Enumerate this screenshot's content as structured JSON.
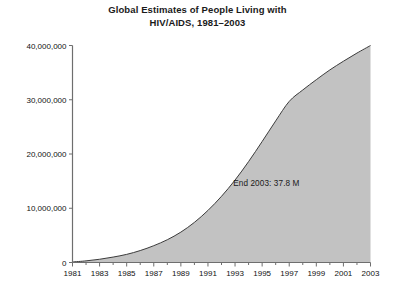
{
  "chart_data": {
    "type": "area",
    "title": "Global Estimates of People Living with HIV/AIDS, 1981–2003",
    "title_line_1": "Global Estimates of People Living with",
    "title_line_2": "HIV/AIDS, 1981–2003",
    "xlabel": "",
    "ylabel": "",
    "xlim": [
      1981,
      2003
    ],
    "ylim": [
      0,
      40000000
    ],
    "grid": false,
    "legend": null,
    "fill_color": "#c2c2c2",
    "line_color": "#3c3c3c",
    "axis_color": "#6e6e6e",
    "annotations": [
      {
        "text": "End 2003: 37.8 M",
        "x": 1997,
        "y": 14500000
      }
    ],
    "ytick_labels": [
      "40,000,000",
      "30,000,000",
      "20,000,000",
      "10,000,000",
      "0"
    ],
    "ytick_values": [
      40000000,
      30000000,
      20000000,
      10000000,
      0
    ],
    "xtick_labels": [
      "1981",
      "1983",
      "1985",
      "1987",
      "1989",
      "1991",
      "1993",
      "1995",
      "1997",
      "1999",
      "2001",
      "2003"
    ],
    "xtick_values": [
      1981,
      1983,
      1985,
      1987,
      1989,
      1991,
      1993,
      1995,
      1997,
      1999,
      2001,
      2003
    ],
    "xminor_values": [
      1982,
      1984,
      1986,
      1988,
      1990,
      1992,
      1994,
      1996,
      1998,
      2000,
      2002
    ],
    "x": [
      1981,
      1982,
      1983,
      1984,
      1985,
      1986,
      1987,
      1988,
      1989,
      1990,
      1991,
      1992,
      1993,
      1994,
      1995,
      1996,
      1997,
      1998,
      1999,
      2000,
      2001,
      2002,
      2003
    ],
    "values": [
      100000,
      300000,
      600000,
      1000000,
      1500000,
      2200000,
      3100000,
      4200000,
      5600000,
      7400000,
      9600000,
      12200000,
      15200000,
      18600000,
      22300000,
      26100000,
      29700000,
      31800000,
      33700000,
      35500000,
      37100000,
      38600000,
      40000000
    ],
    "series": [
      {
        "name": "People living with HIV/AIDS",
        "values": [
          100000,
          300000,
          600000,
          1000000,
          1500000,
          2200000,
          3100000,
          4200000,
          5600000,
          7400000,
          9600000,
          12200000,
          15200000,
          18600000,
          22300000,
          26100000,
          29700000,
          31800000,
          33700000,
          35500000,
          37100000,
          38600000,
          40000000
        ]
      }
    ]
  }
}
